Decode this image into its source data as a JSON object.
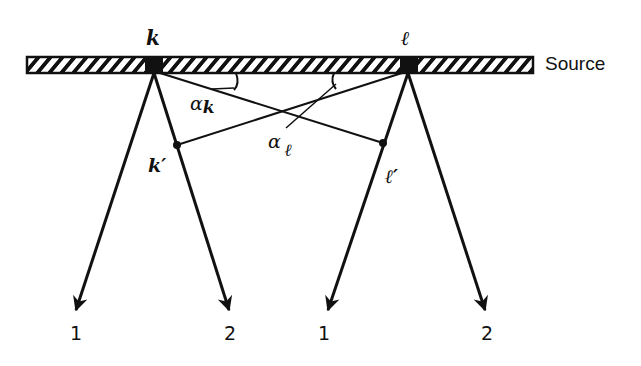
{
  "diagram": {
    "source_label": "Source",
    "points": {
      "k": {
        "label": "k",
        "x": 154,
        "y": 65
      },
      "l": {
        "label": "ℓ",
        "x": 408,
        "y": 65
      },
      "k_prime": {
        "label": "k′",
        "x": 177,
        "y": 145
      },
      "l_prime": {
        "label": "ℓ′",
        "x": 383,
        "y": 143
      }
    },
    "angles": {
      "alpha_k": {
        "symbol": "α",
        "subscript": "k"
      },
      "alpha_l": {
        "symbol": "α",
        "subscript": "ℓ"
      }
    },
    "rays": [
      {
        "from": "k",
        "label": "1"
      },
      {
        "from": "k",
        "label": "2"
      },
      {
        "from": "l",
        "label": "1"
      },
      {
        "from": "l",
        "label": "2"
      }
    ],
    "colors": {
      "ink": "#111111",
      "background": "#ffffff"
    }
  }
}
